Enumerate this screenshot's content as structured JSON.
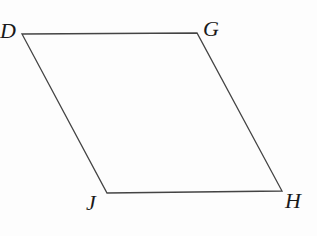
{
  "figure": {
    "shape": "parallelogram",
    "stroke_color": "#444444",
    "vertices": [
      {
        "name": "D",
        "x": 22,
        "y": 34
      },
      {
        "name": "G",
        "x": 197,
        "y": 33
      },
      {
        "name": "H",
        "x": 282,
        "y": 191
      },
      {
        "name": "J",
        "x": 107,
        "y": 193
      }
    ],
    "labels": {
      "D": "D",
      "G": "G",
      "H": "H",
      "J": "J"
    }
  }
}
